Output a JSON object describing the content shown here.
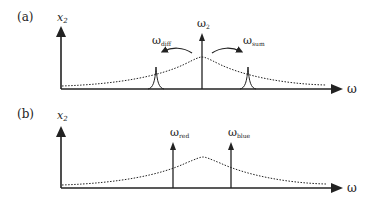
{
  "panels": [
    {
      "id": "a",
      "label": "(a)",
      "y_axis_label": "x",
      "y_axis_sub": "2",
      "x_axis_label": "ω",
      "center_arrow": {
        "label": "ω",
        "sub": "2"
      },
      "left_label": {
        "label": "ω",
        "sub": "diff"
      },
      "right_label": {
        "label": "ω",
        "sub": "sum"
      }
    },
    {
      "id": "b",
      "label": "(b)",
      "y_axis_label": "x",
      "y_axis_sub": "2",
      "x_axis_label": "ω",
      "left_arrow": {
        "label": "ω",
        "sub": "red"
      },
      "right_arrow": {
        "label": "ω",
        "sub": "blue"
      }
    }
  ],
  "colors": {
    "ink": "#222222",
    "background": "#ffffff"
  }
}
